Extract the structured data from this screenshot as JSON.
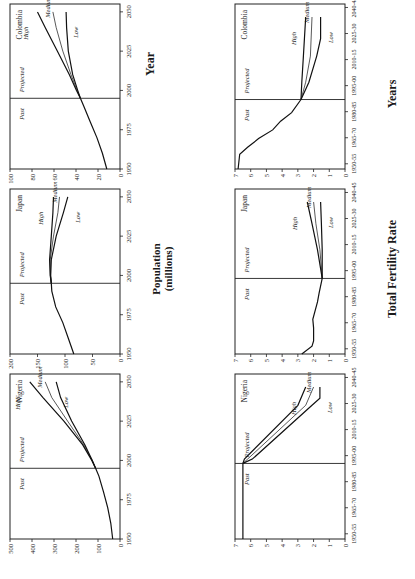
{
  "figure": {
    "orientation": "rotated-90-ccw",
    "population_section": {
      "y_axis_title_line1": "Population",
      "y_axis_title_line2": "(millions)",
      "x_axis_title": "Year"
    },
    "fertility_section": {
      "y_axis_title": "Total Fertility Rate",
      "x_axis_title": "Years"
    },
    "past_label": "Past",
    "projected_label": "Projected"
  },
  "chart_data": [
    {
      "type": "line",
      "title": "Nigeria",
      "panel": "population",
      "xlabel": "Year",
      "ylabel": "Population (millions)",
      "xlim": [
        1950,
        2055
      ],
      "ylim": [
        0,
        500
      ],
      "xticks": [
        1950,
        1975,
        2000,
        2025,
        2050
      ],
      "yticks": [
        0,
        100,
        200,
        300,
        400,
        500
      ],
      "divider_x": 1995,
      "annotations": [
        "Past",
        "Projected"
      ],
      "past": {
        "x": [
          1950,
          1960,
          1970,
          1980,
          1990,
          1995
        ],
        "y": [
          33,
          42,
          56,
          75,
          96,
          111
        ]
      },
      "series": [
        {
          "name": "High",
          "x": [
            1995,
            2000,
            2010,
            2025,
            2040,
            2050
          ],
          "y": [
            111,
            128,
            170,
            255,
            350,
            410
          ]
        },
        {
          "name": "Medium",
          "x": [
            1995,
            2000,
            2010,
            2025,
            2040,
            2050
          ],
          "y": [
            111,
            127,
            165,
            238,
            310,
            340
          ]
        },
        {
          "name": "Low",
          "x": [
            1995,
            2000,
            2010,
            2025,
            2040,
            2050
          ],
          "y": [
            111,
            126,
            160,
            220,
            270,
            290
          ]
        }
      ]
    },
    {
      "type": "line",
      "title": "Japan",
      "panel": "population",
      "xlabel": "Year",
      "ylabel": "Population (millions)",
      "xlim": [
        1950,
        2055
      ],
      "ylim": [
        0,
        200
      ],
      "xticks": [
        1950,
        1975,
        2000,
        2025,
        2050
      ],
      "yticks": [
        0,
        50,
        100,
        150,
        200
      ],
      "divider_x": 1995,
      "annotations": [
        "Past",
        "Projected"
      ],
      "past": {
        "x": [
          1950,
          1960,
          1970,
          1980,
          1990,
          1995
        ],
        "y": [
          84,
          94,
          104,
          117,
          124,
          125
        ]
      },
      "series": [
        {
          "name": "High",
          "x": [
            1995,
            2000,
            2010,
            2025,
            2040,
            2050
          ],
          "y": [
            125,
            127,
            128,
            125,
            122,
            121
          ]
        },
        {
          "name": "Medium",
          "x": [
            1995,
            2000,
            2010,
            2025,
            2040,
            2050
          ],
          "y": [
            125,
            126.5,
            127,
            121,
            113,
            110
          ]
        },
        {
          "name": "Low",
          "x": [
            1995,
            2000,
            2010,
            2025,
            2040,
            2050
          ],
          "y": [
            125,
            126,
            125,
            116,
            103,
            95
          ]
        }
      ]
    },
    {
      "type": "line",
      "title": "Colombia",
      "panel": "population",
      "xlabel": "Year",
      "ylabel": "Population (millions)",
      "xlim": [
        1950,
        2055
      ],
      "ylim": [
        0,
        100
      ],
      "xticks": [
        1950,
        1975,
        2000,
        2025,
        2050
      ],
      "yticks": [
        0,
        20,
        40,
        60,
        80,
        100
      ],
      "divider_x": 1995,
      "annotations": [
        "Past",
        "Projected"
      ],
      "past": {
        "x": [
          1950,
          1960,
          1970,
          1980,
          1990,
          1995
        ],
        "y": [
          12,
          16,
          21,
          27,
          33,
          36
        ]
      },
      "series": [
        {
          "name": "High",
          "x": [
            1995,
            2000,
            2010,
            2025,
            2040,
            2050
          ],
          "y": [
            36,
            39.5,
            46,
            57,
            68,
            75
          ]
        },
        {
          "name": "Medium",
          "x": [
            1995,
            2000,
            2010,
            2025,
            2040,
            2050
          ],
          "y": [
            36,
            39,
            44.5,
            52,
            58,
            61
          ]
        },
        {
          "name": "Low",
          "x": [
            1995,
            2000,
            2010,
            2025,
            2040,
            2050
          ],
          "y": [
            36,
            38.5,
            43,
            47,
            48.5,
            49
          ]
        }
      ]
    },
    {
      "type": "line",
      "title": "Nigeria",
      "panel": "fertility",
      "xlabel": "Years",
      "ylabel": "Total Fertility Rate",
      "xcategories": [
        "1950-55",
        "1965-70",
        "1980-85",
        "1995-00",
        "2010-15",
        "2025-30",
        "2040-45"
      ],
      "xlim": [
        0,
        19
      ],
      "ylim": [
        0,
        7
      ],
      "yticks": [
        0,
        1,
        2,
        3,
        4,
        5,
        6,
        7
      ],
      "divider_x": 8.7,
      "annotations": [
        "Past",
        "Projected"
      ],
      "past": {
        "x": [
          0,
          3,
          6,
          8.7
        ],
        "y": [
          6.5,
          6.5,
          6.5,
          6.5
        ]
      },
      "series": [
        {
          "name": "High",
          "x": [
            8.7,
            9.2,
            15.4,
            17.5
          ],
          "y": [
            6.5,
            6.4,
            3.0,
            2.5
          ]
        },
        {
          "name": "Medium",
          "x": [
            8.7,
            9.2,
            15.4,
            17.5
          ],
          "y": [
            6.5,
            6.2,
            2.5,
            2.0
          ]
        },
        {
          "name": "Low",
          "x": [
            8.7,
            9.2,
            15.4,
            16.2,
            17.5
          ],
          "y": [
            6.5,
            5.9,
            2.1,
            1.6,
            1.6
          ]
        }
      ]
    },
    {
      "type": "line",
      "title": "Japan",
      "panel": "fertility",
      "xlabel": "Years",
      "ylabel": "Total Fertility Rate",
      "xcategories": [
        "1950-55",
        "1965-70",
        "1980-85",
        "1995-00",
        "2010-15",
        "2025-30",
        "2040-45"
      ],
      "xlim": [
        0,
        19
      ],
      "ylim": [
        0,
        7
      ],
      "yticks": [
        0,
        1,
        2,
        3,
        4,
        5,
        6,
        7
      ],
      "divider_x": 8.7,
      "annotations": [
        "Past",
        "Projected"
      ],
      "past": {
        "x": [
          0,
          0.9,
          1.5,
          3,
          4,
          6,
          7,
          8.7
        ],
        "y": [
          2.75,
          2.1,
          2.0,
          2.0,
          2.05,
          1.75,
          1.65,
          1.45
        ]
      },
      "series": [
        {
          "name": "High",
          "x": [
            8.7,
            12,
            15,
            17.5
          ],
          "y": [
            1.45,
            1.75,
            2.1,
            2.4
          ]
        },
        {
          "name": "Medium",
          "x": [
            8.7,
            12,
            15,
            17.5
          ],
          "y": [
            1.45,
            1.6,
            1.85,
            2.0
          ]
        },
        {
          "name": "Low",
          "x": [
            8.7,
            12,
            15,
            17.5
          ],
          "y": [
            1.45,
            1.45,
            1.5,
            1.55
          ]
        }
      ]
    },
    {
      "type": "line",
      "title": "Colombia",
      "panel": "fertility",
      "xlabel": "Years",
      "ylabel": "Total Fertility Rate",
      "xcategories": [
        "1950-55",
        "1965-70",
        "1980-85",
        "1995-00",
        "2010-15",
        "2025-30",
        "2040-45"
      ],
      "xlim": [
        0,
        19
      ],
      "ylim": [
        0,
        7
      ],
      "yticks": [
        0,
        1,
        2,
        3,
        4,
        5,
        6,
        7
      ],
      "divider_x": 8.0,
      "annotations": [
        "Past",
        "Projected"
      ],
      "past": {
        "x": [
          0,
          1.7,
          2.5,
          3.5,
          4.5,
          5.5,
          6.5,
          8.0
        ],
        "y": [
          6.8,
          6.7,
          6.2,
          5.5,
          4.6,
          4.1,
          3.4,
          2.8
        ]
      },
      "series": [
        {
          "name": "High",
          "x": [
            8.0,
            10,
            13,
            17.5
          ],
          "y": [
            2.8,
            2.75,
            2.65,
            2.5
          ]
        },
        {
          "name": "Medium",
          "x": [
            8.0,
            10,
            13,
            17.5
          ],
          "y": [
            2.8,
            2.5,
            2.2,
            2.1
          ]
        },
        {
          "name": "Low",
          "x": [
            8.0,
            10,
            13,
            15,
            17.5
          ],
          "y": [
            2.8,
            2.3,
            1.8,
            1.55,
            1.55
          ]
        }
      ]
    }
  ]
}
